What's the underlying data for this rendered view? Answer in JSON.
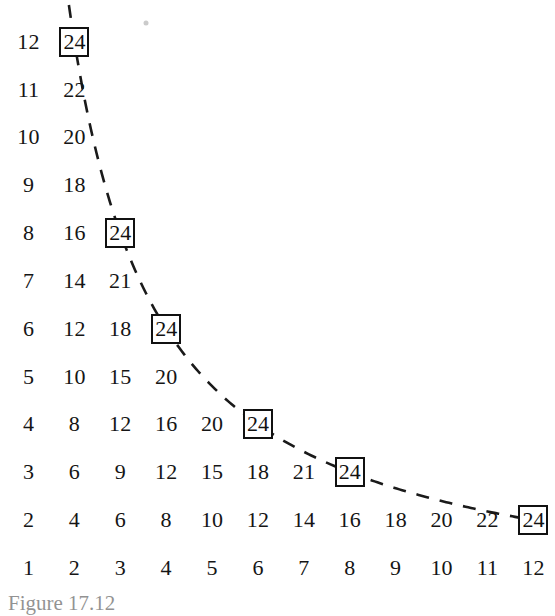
{
  "figure": {
    "caption_partial": "Figure 17.12",
    "highlight_value": "24",
    "box_color": "#111111",
    "curve_color": "#1a1a1a",
    "text_color": "#151515",
    "background": "#ffffff"
  },
  "chart_data": {
    "type": "table",
    "xlabel": "",
    "ylabel": "",
    "xlim": [
      1,
      12
    ],
    "ylim": [
      1,
      12
    ],
    "grid": false,
    "legend": "none",
    "row_labels": [
      "12",
      "11",
      "10",
      "9",
      "8",
      "7",
      "6",
      "5",
      "4",
      "3",
      "2",
      "1"
    ],
    "column_labels": [
      "1",
      "2",
      "3",
      "4",
      "5",
      "6",
      "7",
      "8",
      "9",
      "10",
      "11",
      "12"
    ],
    "rows": [
      {
        "multiplier": 12,
        "values": [
          "12",
          "24"
        ]
      },
      {
        "multiplier": 11,
        "values": [
          "11",
          "22"
        ]
      },
      {
        "multiplier": 10,
        "values": [
          "10",
          "20"
        ]
      },
      {
        "multiplier": 9,
        "values": [
          "9",
          "18"
        ]
      },
      {
        "multiplier": 8,
        "values": [
          "8",
          "16",
          "24"
        ]
      },
      {
        "multiplier": 7,
        "values": [
          "7",
          "14",
          "21"
        ]
      },
      {
        "multiplier": 6,
        "values": [
          "6",
          "12",
          "18",
          "24"
        ]
      },
      {
        "multiplier": 5,
        "values": [
          "5",
          "10",
          "15",
          "20"
        ]
      },
      {
        "multiplier": 4,
        "values": [
          "4",
          "8",
          "12",
          "16",
          "20",
          "24"
        ]
      },
      {
        "multiplier": 3,
        "values": [
          "3",
          "6",
          "9",
          "12",
          "15",
          "18",
          "21",
          "24"
        ]
      },
      {
        "multiplier": 2,
        "values": [
          "2",
          "4",
          "6",
          "8",
          "10",
          "12",
          "14",
          "16",
          "18",
          "20",
          "22",
          "24"
        ]
      },
      {
        "multiplier": 1,
        "values": [
          "1",
          "2",
          "3",
          "4",
          "5",
          "6",
          "7",
          "8",
          "9",
          "10",
          "11",
          "12"
        ]
      }
    ],
    "boxed_cells": [
      {
        "row": 12,
        "col": 2,
        "label": "24"
      },
      {
        "row": 8,
        "col": 3,
        "label": "24"
      },
      {
        "row": 6,
        "col": 4,
        "label": "24"
      },
      {
        "row": 4,
        "col": 6,
        "label": "24"
      },
      {
        "row": 3,
        "col": 8,
        "label": "24"
      },
      {
        "row": 2,
        "col": 12,
        "label": "24"
      }
    ],
    "curve": {
      "equation": "xy = 24",
      "style": "dashed",
      "points": [
        [
          2,
          12
        ],
        [
          3,
          8
        ],
        [
          4,
          6
        ],
        [
          6,
          4
        ],
        [
          8,
          3
        ],
        [
          12,
          2
        ]
      ]
    }
  }
}
